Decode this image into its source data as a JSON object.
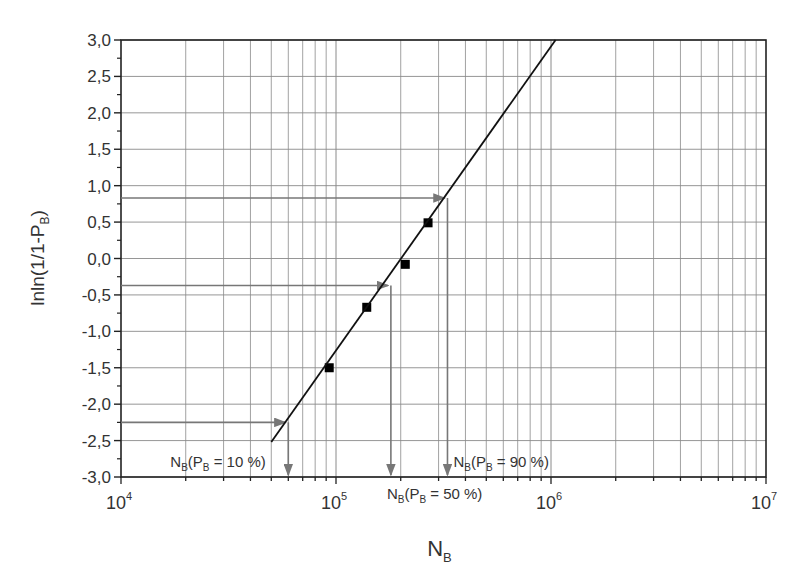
{
  "chart_data": {
    "type": "scatter",
    "title": "",
    "xlabel": "N",
    "xlabel_sub": "B",
    "ylabel": "lnln(1/1-P",
    "ylabel_sub": "B",
    "ylabel_close": ")",
    "xscale": "log",
    "xlim": [
      10000,
      10000000
    ],
    "ylim": [
      -3.0,
      3.0
    ],
    "grid": true,
    "x_ticks": [
      {
        "base": "10",
        "exp": "4",
        "value": 10000
      },
      {
        "base": "10",
        "exp": "5",
        "value": 100000
      },
      {
        "base": "10",
        "exp": "6",
        "value": 1000000
      },
      {
        "base": "10",
        "exp": "7",
        "value": 10000000
      }
    ],
    "y_ticks": [
      "3,0",
      "2,5",
      "2,0",
      "1,5",
      "1,0",
      "0,5",
      "0,0",
      "-0,5",
      "-1,0",
      "-1,5",
      "-2,0",
      "-2,5",
      "-3,0"
    ],
    "series": [
      {
        "name": "measured",
        "marker": "square",
        "points": [
          {
            "x": 93000,
            "y": -1.5
          },
          {
            "x": 139000,
            "y": -0.67
          },
          {
            "x": 210000,
            "y": -0.08
          },
          {
            "x": 268000,
            "y": 0.49
          }
        ]
      },
      {
        "name": "fit line",
        "style": "line",
        "points": [
          {
            "x": 50000,
            "y": -2.52
          },
          {
            "x": 1050000,
            "y": 3.0
          }
        ]
      }
    ],
    "annotations": [
      {
        "label_main": "N",
        "label_sub1": "B",
        "label_mid": "(P",
        "label_sub2": "B",
        "label_end": " = 10 %)",
        "y": -2.25,
        "x": 60000
      },
      {
        "label_main": "N",
        "label_sub1": "B",
        "label_mid": "(P",
        "label_sub2": "B",
        "label_end": " = 50 %)",
        "y": -0.37,
        "x": 180000
      },
      {
        "label_main": "N",
        "label_sub1": "B",
        "label_mid": "(P",
        "label_sub2": "B",
        "label_end": " = 90 %)",
        "y": 0.83,
        "x": 330000
      }
    ]
  }
}
